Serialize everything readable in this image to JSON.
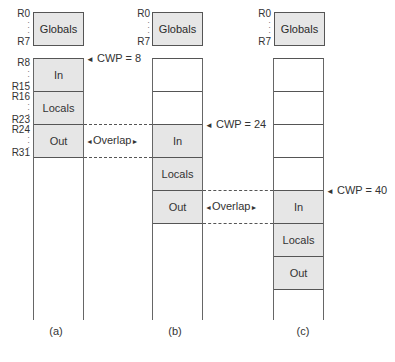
{
  "diagram": {
    "type": "register-window-overlap",
    "register_labels": {
      "globals_top": "R0",
      "globals_bottom": "R7",
      "in_top": "R8",
      "in_bottom": "R15",
      "locals_top": "R16",
      "locals_bottom": "R23",
      "out_top": "R24",
      "out_bottom": "R31"
    },
    "columns": [
      {
        "id": "a",
        "caption": "(a)",
        "globals_label": "Globals",
        "cells": [
          "In",
          "Locals",
          "Out",
          "",
          "",
          "",
          "",
          ""
        ],
        "cwp_label": "CWP = 8",
        "overlap_label": "Overlap"
      },
      {
        "id": "b",
        "caption": "(b)",
        "globals_label": "Globals",
        "cells": [
          "",
          "",
          "In",
          "Locals",
          "Out",
          "",
          "",
          ""
        ],
        "cwp_label": "CWP = 24",
        "overlap_label": "Overlap"
      },
      {
        "id": "c",
        "caption": "(c)",
        "globals_label": "Globals",
        "cells": [
          "",
          "",
          "",
          "",
          "In",
          "Locals",
          "Out",
          ""
        ],
        "cwp_label": "CWP = 40"
      }
    ],
    "arrow_glyphs": {
      "left": "◄",
      "right": "►"
    }
  }
}
